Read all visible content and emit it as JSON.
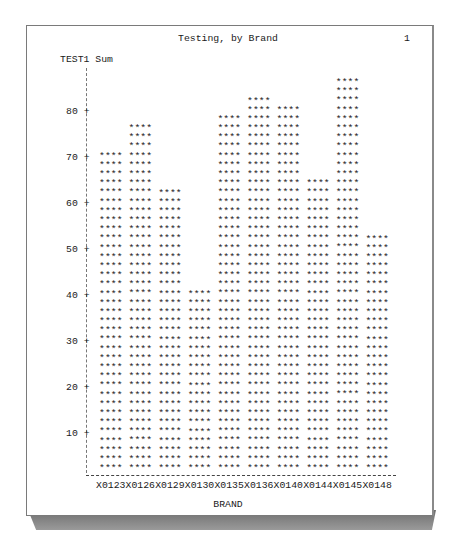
{
  "page": {
    "number": "1",
    "title": "Testing, by Brand"
  },
  "chart_data": {
    "type": "bar",
    "title": "Testing, by Brand",
    "xlabel": "BRAND",
    "ylabel": "TEST1 Sum",
    "categories": [
      "X0123",
      "X0126",
      "X0129",
      "X0130",
      "X0135",
      "X0136",
      "X0140",
      "X0144",
      "X0145",
      "X0148"
    ],
    "values": [
      70,
      76,
      62,
      40,
      78,
      82,
      80,
      64,
      86,
      52
    ],
    "ylim": [
      0,
      88
    ],
    "yticks": [
      10,
      20,
      30,
      40,
      50,
      60,
      70,
      80
    ],
    "grid": false,
    "legend": "none",
    "bar_symbol": "****",
    "units_per_line": 2
  },
  "axis": {
    "ytick_labels": [
      "80",
      "70",
      "60",
      "50",
      "40",
      "30",
      "20",
      "10"
    ]
  }
}
